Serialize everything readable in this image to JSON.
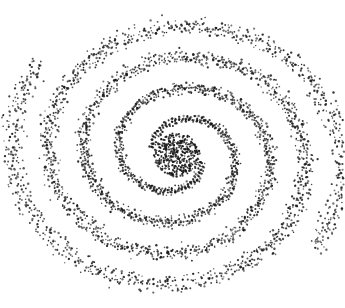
{
  "image": {
    "subject": "stippled spiral",
    "description": "Two-armed spiral drawn with black dots on white background, dense circular core",
    "width": 345,
    "height": 308,
    "background": "#ffffff",
    "dot_color": "#1a1a1a"
  },
  "spiral": {
    "center": [
      177,
      155
    ],
    "core_radius": 22,
    "core_dots": 420,
    "arms": 2,
    "start_radius": 24,
    "growth_per_radian": 10.5,
    "turns": 2.05,
    "x_scale": 1.08,
    "y_scale": 0.95,
    "rotation_deg": 200,
    "arm_width_start": 5,
    "arm_width_end": 16,
    "dot_density": 7
  }
}
